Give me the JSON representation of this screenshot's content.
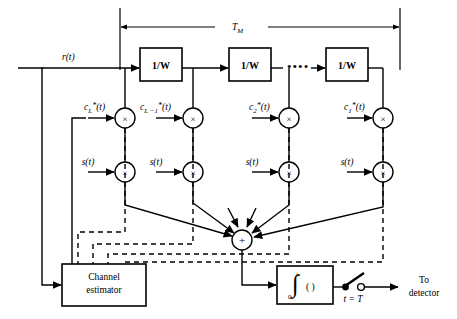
{
  "figure": {
    "type": "block-diagram",
    "width": 457,
    "height": 319,
    "background": "#ffffff",
    "line_color": "#000000"
  },
  "labels": {
    "input_signal": "r(t)",
    "span_label": "T",
    "span_label_sub": "M",
    "delay_block": "1/W",
    "ellipsis": "••••",
    "summer": "+",
    "integrator_symbol": "∫",
    "integrator_upper": "t",
    "integrator_lower": "0",
    "integrator_arg": "( )",
    "sampler_label": "t = T",
    "output_line1": "To",
    "output_line2": "detector",
    "estimator_line1": "Channel",
    "estimator_line2": "estimator",
    "multiplier_symbol": "×",
    "reference_signal": "s(t)"
  },
  "delay_blocks": [
    {
      "name": "delay-1",
      "label": "1/W",
      "x": 140,
      "y": 48,
      "w": 42,
      "h": 33
    },
    {
      "name": "delay-2",
      "label": "1/W",
      "x": 229,
      "y": 48,
      "w": 42,
      "h": 33
    },
    {
      "name": "delay-3",
      "label": "1/W",
      "x": 326,
      "y": 48,
      "w": 42,
      "h": 33
    }
  ],
  "taps": [
    {
      "index": 0,
      "coef": "c",
      "coef_sub": "L",
      "coef_sup": "*",
      "coef_arg": "(t)",
      "tap_x": 125,
      "label_x": 84
    },
    {
      "index": 1,
      "coef": "c",
      "coef_sub": "L −1",
      "coef_sup": "*",
      "coef_arg": "(t)",
      "tap_x": 193,
      "label_x": 140
    },
    {
      "index": 2,
      "coef": "c",
      "coef_sub": "2",
      "coef_sup": "*",
      "coef_arg": "(t)",
      "tap_x": 289,
      "label_x": 249
    },
    {
      "index": 3,
      "coef": "c",
      "coef_sub": "1",
      "coef_sup": "*",
      "coef_arg": "(t)",
      "tap_x": 383,
      "label_x": 340
    }
  ],
  "rows": {
    "signal_line_y": 68,
    "coef_multiplier_y": 118,
    "ref_multiplier_y": 172,
    "summer_y": 240,
    "estimator_y": 268
  },
  "summer": {
    "name": "summing-junction",
    "cx": 242,
    "cy": 240,
    "r": 10
  },
  "estimator": {
    "name": "channel-estimator",
    "x": 62,
    "y": 264,
    "w": 84,
    "h": 42
  },
  "integrator": {
    "name": "integrator-block",
    "x": 277,
    "y": 266,
    "w": 56,
    "h": 38
  },
  "sampler": {
    "name": "sampler-switch",
    "cx": 352,
    "cy": 287
  },
  "span": {
    "name": "tm-span",
    "x1": 120,
    "x2": 400,
    "y": 27,
    "tick_top": 8,
    "tick_bottom": 70
  }
}
